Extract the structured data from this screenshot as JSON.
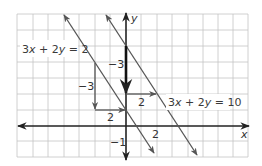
{
  "figure": {
    "type": "coordinate-graph",
    "axes": {
      "x_label": "x",
      "y_label": "y",
      "x_range": [
        -7,
        8
      ],
      "y_range": [
        -2,
        7
      ]
    },
    "lines": [
      {
        "equation": "3x + 2y = 2",
        "eq_parts": [
          "3",
          "x",
          " + 2",
          "y",
          " = 2"
        ],
        "color": "#555555"
      },
      {
        "equation": "3x + 2y = 10",
        "eq_parts": [
          "3",
          "x",
          " + 2",
          "y",
          " = 10"
        ],
        "color": "#555555"
      }
    ],
    "slope_triangles": [
      {
        "rise_label": "−3",
        "run_label": "2",
        "from": [
          -2,
          4
        ],
        "corner": [
          -2,
          1
        ],
        "to": [
          0,
          1
        ]
      },
      {
        "rise_label": "−3",
        "run_label": "2",
        "from": [
          0,
          5
        ],
        "corner": [
          0,
          2
        ],
        "to": [
          2,
          2
        ]
      }
    ],
    "tick_labels": {
      "x_tick": "2",
      "y_tick": "−1"
    },
    "colors": {
      "grid": "#c4c4c4",
      "axis": "#222222",
      "line": "#555555",
      "highlight": "#111111"
    }
  }
}
